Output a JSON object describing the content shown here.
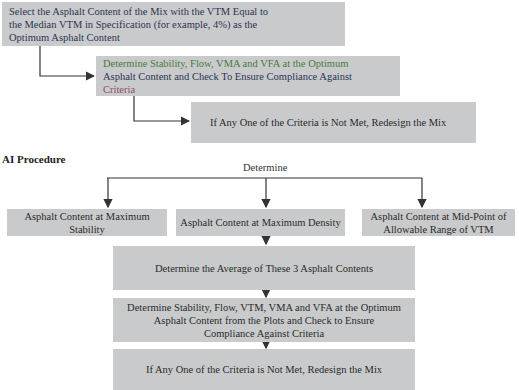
{
  "top_flow": {
    "step1": {
      "lines": [
        "Select the Asphalt Content of the Mix with the VTM Equal to",
        "the Median VTM in Specification (for example, 4%) as the",
        "Optimum Asphalt Content"
      ]
    },
    "step2": {
      "lines": [
        "Determine Stability, Flow, VMA and VFA at the Optimum",
        "Asphalt Content and Check To Ensure Compliance Against",
        "Criteria"
      ]
    },
    "step3": {
      "text": "If Any One of the Criteria is Not Met, Redesign the Mix"
    }
  },
  "ai_procedure": {
    "heading": "AI Procedure",
    "determine_label": "Determine",
    "branches": [
      {
        "lines": [
          "Asphalt Content at Maximum",
          "Stability"
        ]
      },
      {
        "lines": [
          "Asphalt Content at Maximum Density"
        ]
      },
      {
        "lines": [
          "Asphalt Content at Mid-Point of",
          "Allowable Range of VTM"
        ]
      }
    ],
    "average_step": "Determine the Average of These 3 Asphalt Contents",
    "check_step": {
      "lines": [
        "Determine Stability, Flow, VTM, VMA and VFA at the Optimum",
        "Asphalt Content from the Plots and Check to Ensure",
        "Compliance Against Criteria"
      ]
    },
    "final_step": "If Any One of the Criteria is Not Met, Redesign the Mix"
  },
  "colors": {
    "box_fill": "#c9cacc",
    "arrow": "#333333",
    "text_navy": "#2b3550",
    "text_green": "#4a7a3a"
  }
}
